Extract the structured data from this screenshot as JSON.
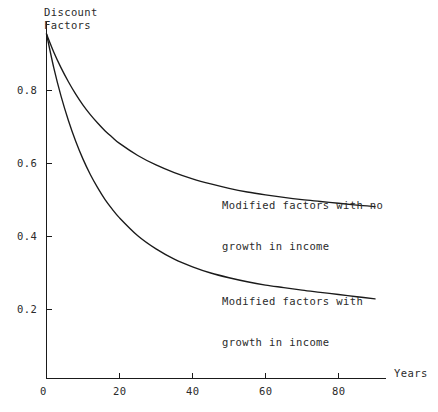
{
  "chart_data": {
    "type": "line",
    "title": "",
    "xlabel": "Years",
    "ylabel": "Discount Factors",
    "ylabel_line1": "Discount",
    "ylabel_line2": "Factors",
    "xlim": [
      0,
      93
    ],
    "ylim": [
      0,
      1.0
    ],
    "grid": false,
    "legend_position": "inline-annotations",
    "x_ticks": [
      "0",
      "20",
      "40",
      "60",
      "80"
    ],
    "x_tick_values": [
      0,
      20,
      40,
      60,
      80
    ],
    "y_ticks": [
      "0.2",
      "0.4",
      "0.6",
      "0.8"
    ],
    "y_tick_values": [
      0.2,
      0.4,
      0.6,
      0.8
    ],
    "x": [
      0,
      2,
      4,
      6,
      8,
      10,
      12,
      14,
      16,
      18,
      20,
      25,
      30,
      35,
      40,
      45,
      50,
      55,
      60,
      65,
      70,
      75,
      80,
      85,
      90
    ],
    "series": [
      {
        "name": "Modified factors with no growth in income",
        "annotation_line1": "Modified factors with no",
        "annotation_line2": "growth in income",
        "asymptote": 0.478,
        "values": [
          0.955,
          0.905,
          0.862,
          0.824,
          0.79,
          0.76,
          0.734,
          0.711,
          0.69,
          0.672,
          0.655,
          0.622,
          0.596,
          0.575,
          0.558,
          0.544,
          0.532,
          0.522,
          0.514,
          0.507,
          0.501,
          0.496,
          0.491,
          0.486,
          0.482
        ]
      },
      {
        "name": "Modified factors with growth in income",
        "annotation_line1": "Modified factors with",
        "annotation_line2": "growth in income",
        "asymptote": 0.214,
        "values": [
          0.955,
          0.862,
          0.784,
          0.718,
          0.661,
          0.612,
          0.57,
          0.534,
          0.502,
          0.475,
          0.451,
          0.402,
          0.366,
          0.338,
          0.317,
          0.3,
          0.287,
          0.276,
          0.267,
          0.26,
          0.253,
          0.247,
          0.241,
          0.235,
          0.229
        ]
      }
    ]
  },
  "axis": {
    "y_axis_name": "y-axis",
    "x_axis_name": "x-axis"
  }
}
